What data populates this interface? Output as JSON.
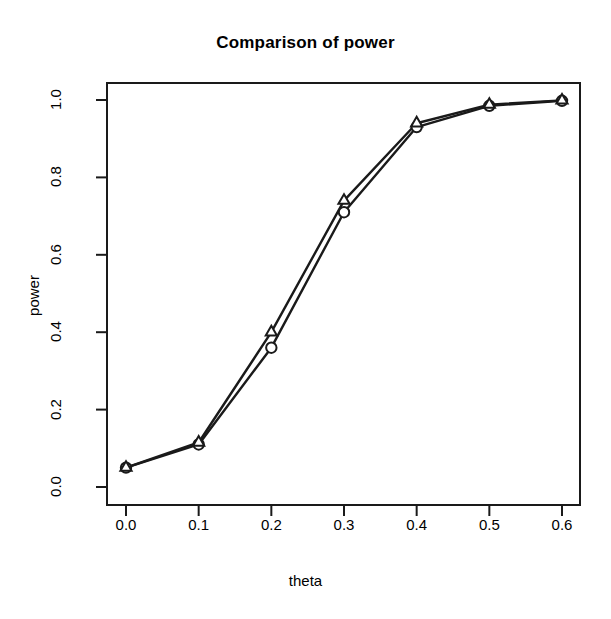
{
  "chart_data": {
    "type": "line",
    "title": "Comparison of power",
    "xlabel": "theta",
    "ylabel": "power",
    "x": [
      0.0,
      0.1,
      0.2,
      0.3,
      0.4,
      0.5,
      0.6
    ],
    "series": [
      {
        "name": "circle-series",
        "marker": "circle",
        "values": [
          0.05,
          0.11,
          0.36,
          0.71,
          0.93,
          0.985,
          0.998
        ]
      },
      {
        "name": "triangle-series",
        "marker": "triangle",
        "values": [
          0.05,
          0.115,
          0.4,
          0.74,
          0.94,
          0.988,
          0.999
        ]
      }
    ],
    "xlim": [
      -0.02,
      0.62
    ],
    "ylim": [
      0.0,
      1.0
    ],
    "xticks": [
      "0.0",
      "0.1",
      "0.2",
      "0.3",
      "0.4",
      "0.5",
      "0.6"
    ],
    "xtick_values": [
      0.0,
      0.1,
      0.2,
      0.3,
      0.4,
      0.5,
      0.6
    ],
    "yticks": [
      "0.0",
      "0.2",
      "0.4",
      "0.6",
      "0.8",
      "1.0"
    ],
    "ytick_values": [
      0.0,
      0.2,
      0.4,
      0.6,
      0.8,
      1.0
    ],
    "grid": false,
    "legend": "none",
    "line_color": "#1a1a1a",
    "axis_color": "#1a1a1a",
    "background": "#ffffff"
  }
}
